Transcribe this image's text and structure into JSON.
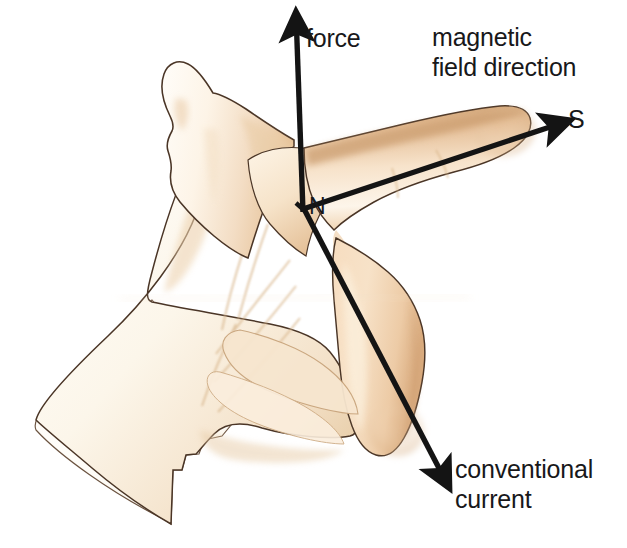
{
  "diagram": {
    "background_color": "#ffffff",
    "arrow_color": "#141414",
    "text_color": "#18181a",
    "skin": {
      "base": "#fdf6ec",
      "pale": "#fcf8f1",
      "mid": "#f2d9bd",
      "tan": "#e3b88c",
      "deep": "#c99a6d",
      "outline": "#4a3526",
      "shadow": "#d8b793"
    },
    "labels": {
      "force": "force",
      "magnetic_field": "magnetic\nfield direction",
      "south_pole": "S",
      "north_pole": "N",
      "conventional_current": "conventional\ncurrent"
    },
    "arrows": [
      {
        "name": "force-arrow",
        "label": "force",
        "direction": "up",
        "from": [
          303,
          208
        ],
        "to": [
          296,
          22
        ]
      },
      {
        "name": "magnetic-field-arrow",
        "label": "magnetic field direction",
        "direction": "upper-right",
        "from": [
          303,
          208
        ],
        "to": [
          563,
          122
        ]
      },
      {
        "name": "conventional-current-arrow",
        "label": "conventional current",
        "direction": "lower-right",
        "from": [
          303,
          208
        ],
        "to": [
          446,
          483
        ]
      }
    ],
    "hand": {
      "name": "left-hand-photograph",
      "description": "left hand with thumb up, index finger extended, remaining fingers curled",
      "parts": [
        "thumb",
        "index-finger",
        "middle-finger",
        "ring-finger",
        "little-finger",
        "palm",
        "wrist"
      ]
    }
  }
}
